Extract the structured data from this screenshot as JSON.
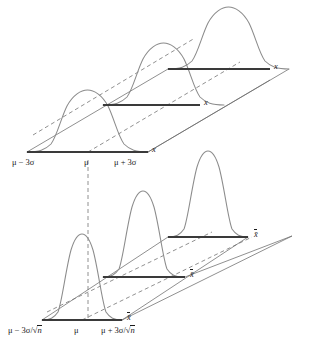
{
  "figure": {
    "colors": {
      "curve": "#8c8c8c",
      "axis": "#3a3a3a",
      "guide_solid": "#6b6b6b",
      "guide_dashed": "#6b6b6b",
      "text": "#1a1a1a",
      "background": "#ffffff"
    },
    "panels": [
      {
        "id": "population-distribution",
        "name": "distribution-of-individual-values",
        "axis_variable": "x",
        "tick_labels": {
          "left": "μ − 3σ",
          "center": "μ",
          "right": "μ + 3σ"
        },
        "curve_count": 3,
        "curve_shape": "wide-normal",
        "endpoint_labels": [
          "x",
          "x",
          "x"
        ]
      },
      {
        "id": "sampling-distribution",
        "name": "sampling-distribution-of-the-mean",
        "axis_variable": "x̄",
        "tick_labels": {
          "left_mu": "μ − 3σ/",
          "left_radicand": "n",
          "center": "μ",
          "right_mu": "μ + 3σ/",
          "right_radicand": "n"
        },
        "curve_count": 3,
        "curve_shape": "narrow-normal",
        "endpoint_labels": [
          "x̄",
          "x̄",
          "x̄"
        ]
      }
    ],
    "connector": {
      "name": "mu-vertical-dashed-line",
      "style": "dashed",
      "description": "vertical dashed line aligning μ of the upper axis with μ of the lower axis"
    }
  }
}
